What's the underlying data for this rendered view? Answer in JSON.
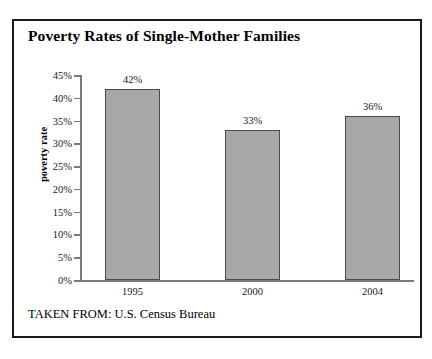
{
  "figure": {
    "title": "Poverty Rates of Single-Mother Families",
    "source_note": "TAKEN FROM: U.S. Census Bureau",
    "colors": {
      "bar_fill": "#a8a8a8",
      "bar_outline": "#4a4a4a",
      "frame": "#1a1a1a",
      "axis": "#7a7a7a",
      "background": "#ffffff",
      "text": "#000000"
    }
  },
  "chart_data": {
    "type": "bar",
    "title": "Poverty Rates of Single-Mother Families",
    "xlabel": "",
    "ylabel": "poverty rate",
    "categories": [
      "1995",
      "2000",
      "2004"
    ],
    "values": [
      42,
      33,
      36
    ],
    "value_labels": [
      "42%",
      "33%",
      "36%"
    ],
    "ylim": [
      0,
      45
    ],
    "ytick_values": [
      0,
      5,
      10,
      15,
      20,
      25,
      30,
      35,
      40,
      45
    ],
    "ytick_labels": [
      "0%",
      "5%",
      "10%",
      "15%",
      "20%",
      "25%",
      "30%",
      "35%",
      "40%",
      "45%"
    ],
    "grid": false,
    "legend": false,
    "units": "percent",
    "annotation": "TAKEN FROM: U.S. Census Bureau"
  }
}
